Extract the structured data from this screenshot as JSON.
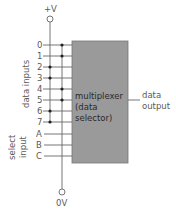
{
  "diagram": {
    "supply_top_label": "+V",
    "supply_bottom_label": "0V",
    "box": {
      "line1": "multiplexer",
      "line2": "(data",
      "line3": "selector)",
      "fill": "#9a9a9a"
    },
    "output_label_1": "data",
    "output_label_2": "output",
    "data_inputs_label": "data inputs",
    "select_input_label_1": "select",
    "select_input_label_2": "input",
    "data_inputs": [
      {
        "label": "0",
        "tied_to": "0V"
      },
      {
        "label": "1",
        "tied_to": "0V"
      },
      {
        "label": "2",
        "tied_to": "+V"
      },
      {
        "label": "3",
        "tied_to": "+V"
      },
      {
        "label": "4",
        "tied_to": "0V"
      },
      {
        "label": "5",
        "tied_to": "0V"
      },
      {
        "label": "6",
        "tied_to": "+V"
      },
      {
        "label": "7",
        "tied_to": "+V"
      }
    ],
    "select_inputs": [
      {
        "label": "A"
      },
      {
        "label": "B"
      },
      {
        "label": "C"
      }
    ]
  }
}
